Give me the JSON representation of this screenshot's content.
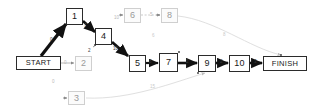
{
  "diagram": {
    "type": "activity-on-node-network",
    "colors": {
      "critical_path": "#111111",
      "non_critical_path": "#d8d8d8",
      "node_border": "#2b2b2b",
      "faded_node_border": "#cfcfcf",
      "background": "#ffffff"
    },
    "nodes": [
      {
        "id": "start",
        "label": "START",
        "x": 16,
        "y": 56,
        "w": 45,
        "h": 14,
        "state": "active",
        "kind": "terminal"
      },
      {
        "id": "n1",
        "label": "1",
        "x": 66,
        "y": 8,
        "w": 17,
        "h": 17,
        "state": "active",
        "kind": "task"
      },
      {
        "id": "n2",
        "label": "2",
        "x": 75,
        "y": 56,
        "w": 17,
        "h": 15,
        "state": "faded",
        "kind": "task"
      },
      {
        "id": "n3",
        "label": "3",
        "x": 68,
        "y": 91,
        "w": 17,
        "h": 14,
        "state": "faded",
        "kind": "task"
      },
      {
        "id": "n4",
        "label": "4",
        "x": 95,
        "y": 28,
        "w": 17,
        "h": 17,
        "state": "active",
        "kind": "task"
      },
      {
        "id": "n5",
        "label": "5",
        "x": 129,
        "y": 55,
        "w": 17,
        "h": 17,
        "state": "active",
        "kind": "task"
      },
      {
        "id": "n6",
        "label": "6",
        "x": 124,
        "y": 8,
        "w": 17,
        "h": 15,
        "state": "faded",
        "kind": "task"
      },
      {
        "id": "n7",
        "label": "7",
        "x": 159,
        "y": 53,
        "w": 19,
        "h": 19,
        "state": "active",
        "kind": "task"
      },
      {
        "id": "n8",
        "label": "8",
        "x": 161,
        "y": 8,
        "w": 17,
        "h": 15,
        "state": "faded",
        "kind": "task"
      },
      {
        "id": "n9",
        "label": "9",
        "x": 198,
        "y": 55,
        "w": 18,
        "h": 17,
        "state": "active",
        "kind": "task"
      },
      {
        "id": "n10",
        "label": "10",
        "x": 229,
        "y": 55,
        "w": 21,
        "h": 17,
        "state": "active",
        "kind": "task"
      },
      {
        "id": "finish",
        "label": "FINISH",
        "x": 263,
        "y": 56,
        "w": 44,
        "h": 15,
        "state": "active",
        "kind": "terminal"
      }
    ],
    "edges": [
      {
        "id": "e-start-1",
        "from": "start",
        "to": "n1",
        "weight": "0",
        "state": "critical",
        "label_x": 50,
        "label_y": 38
      },
      {
        "id": "e-start-2",
        "from": "start",
        "to": "n2",
        "weight": "0",
        "state": "non-critical",
        "label_x": 64,
        "label_y": 61
      },
      {
        "id": "e-start-3",
        "from": "start",
        "to": "n3",
        "weight": "0",
        "state": "non-critical",
        "label_x": 52,
        "label_y": 80
      },
      {
        "id": "e-1-4",
        "from": "n1",
        "to": "n4",
        "weight": "7",
        "state": "critical",
        "label_x": 84,
        "label_y": 24
      },
      {
        "id": "e-2-4",
        "from": "n2",
        "to": "n4",
        "weight": "2",
        "state": "non-critical",
        "label_x": 88,
        "label_y": 49
      },
      {
        "id": "e-4-5",
        "from": "n4",
        "to": "n5",
        "weight": "10",
        "state": "critical",
        "label_x": 113,
        "label_y": 47
      },
      {
        "id": "e-6-8",
        "from": "n6",
        "to": "n8",
        "weight": "5",
        "state": "non-critical",
        "label_x": 150,
        "label_y": 13
      },
      {
        "id": "e-in-6",
        "from": "n4",
        "to": "n6",
        "weight": "10",
        "state": "non-critical",
        "label_x": 114,
        "label_y": 16
      },
      {
        "id": "e-5-7",
        "from": "n5",
        "to": "n7",
        "weight": "8",
        "state": "critical",
        "label_x": 149,
        "label_y": 60
      },
      {
        "id": "e-7-9",
        "from": "n7",
        "to": "n9",
        "weight": "2",
        "state": "critical",
        "label_x": 186,
        "label_y": 60
      },
      {
        "id": "e-9-10",
        "from": "n9",
        "to": "n10",
        "weight": "2",
        "state": "critical",
        "label_x": 220,
        "label_y": 60
      },
      {
        "id": "e-10-finish",
        "from": "n10",
        "to": "finish",
        "weight": "3",
        "state": "critical",
        "label_x": 254,
        "label_y": 60
      },
      {
        "id": "e-8-finish",
        "from": "n8",
        "to": "finish",
        "weight": "8",
        "state": "non-critical",
        "label_x": 223,
        "label_y": 33
      },
      {
        "id": "e-3-9",
        "from": "n3",
        "to": "n9",
        "weight": "15",
        "state": "non-critical",
        "label_x": 150,
        "label_y": 85
      },
      {
        "id": "e-mid-note",
        "from": "n6",
        "to": "n5",
        "weight": "6",
        "state": "non-critical",
        "label_x": 152,
        "label_y": 34
      }
    ]
  }
}
